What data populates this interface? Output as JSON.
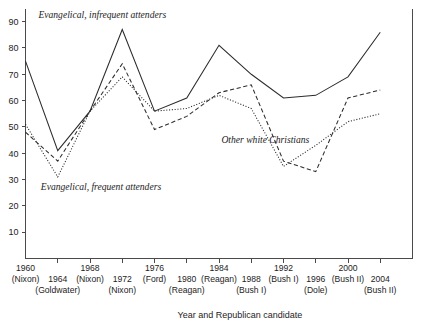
{
  "chart_data": {
    "type": "line",
    "title": "",
    "xlabel": "Year and Republican candidate",
    "ylabel": "",
    "ylim": [
      0,
      95
    ],
    "yticks": [
      10,
      20,
      30,
      40,
      50,
      60,
      70,
      80,
      90
    ],
    "grid": false,
    "legend_position": "inline-annotations",
    "x": [
      1960,
      1964,
      1968,
      1972,
      1976,
      1980,
      1984,
      1988,
      1992,
      1996,
      2000,
      2004
    ],
    "categories": [
      "1960 (Nixon)",
      "1964 (Goldwater)",
      "1968 (Nixon)",
      "1972 (Nixon)",
      "1976 (Ford)",
      "1980 (Reagan)",
      "1984 (Reagan)",
      "1988 (Bush I)",
      "1992 (Bush I)",
      "1996 (Dole)",
      "2000 (Bush II)",
      "2004 (Bush II)"
    ],
    "xtick_years": [
      "1960",
      "1964",
      "1968",
      "1972",
      "1976",
      "1980",
      "1984",
      "1988",
      "1992",
      "1996",
      "2000",
      "2004"
    ],
    "xtick_candidates": [
      "(Nixon)",
      "(Goldwater)",
      "(Nixon)",
      "(Nixon)",
      "(Ford)",
      "(Reagan)",
      "(Reagan)",
      "(Bush I)",
      "(Bush I)",
      "(Dole)",
      "(Bush II)",
      "(Bush II)"
    ],
    "series": [
      {
        "name": "Evangelical, infrequent attenders",
        "style": "solid",
        "values": [
          75,
          41,
          56,
          87,
          56,
          61,
          81,
          70,
          61,
          62,
          69,
          86
        ]
      },
      {
        "name": "Evangelical, frequent attenders",
        "style": "dashed",
        "values": [
          48,
          37,
          56,
          74,
          49,
          54,
          63,
          66,
          37,
          33,
          61,
          64
        ]
      },
      {
        "name": "Other white Christians",
        "style": "dotted",
        "values": [
          51,
          31,
          56,
          69,
          56,
          57,
          62,
          57,
          35,
          43,
          52,
          55
        ]
      }
    ],
    "annotations": [
      {
        "text": "Evangelical, infrequent attenders",
        "x_val": 1961.6,
        "y_val": 91.5
      },
      {
        "text": "Evangelical, frequent attenders",
        "x_val": 1961.9,
        "y_val": 26.0
      },
      {
        "text": "Other white Christians",
        "x_val": 1984.3,
        "y_val": 44.0
      }
    ]
  }
}
